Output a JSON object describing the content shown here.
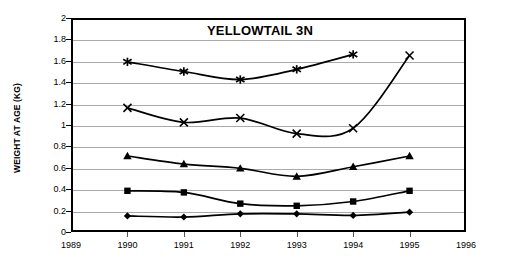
{
  "chart_data": {
    "type": "line",
    "title": "YELLOWTAIL 3N",
    "xlabel": "",
    "ylabel": "WEIGHT AT AGE (KG)",
    "xlim": [
      1989,
      1996
    ],
    "ylim": [
      0,
      2
    ],
    "grid": true,
    "legend": "none",
    "x": [
      1990,
      1991,
      1992,
      1993,
      1994,
      1995
    ],
    "xticks": [
      "1989",
      "1990",
      "1991",
      "1992",
      "1993",
      "1994",
      "1995",
      "1996"
    ],
    "xtick_values": [
      1989,
      1990,
      1991,
      1992,
      1993,
      1994,
      1995,
      1996
    ],
    "yticks": [
      "0",
      "0.2",
      "0.4",
      "0.6",
      "0.8",
      "1",
      "1.2",
      "1.4",
      "1.6",
      "1.8",
      "2"
    ],
    "ytick_values": [
      0,
      0.2,
      0.4,
      0.6,
      0.8,
      1,
      1.2,
      1.4,
      1.6,
      1.8,
      2
    ],
    "series": [
      {
        "name": "Age 1",
        "marker": "diamond",
        "x": [
          1990,
          1991,
          1992,
          1993,
          1994,
          1995
        ],
        "values": [
          0.15,
          0.14,
          0.17,
          0.17,
          0.155,
          0.185
        ]
      },
      {
        "name": "Age 2",
        "marker": "square",
        "x": [
          1990,
          1991,
          1992,
          1993,
          1994,
          1995
        ],
        "values": [
          0.385,
          0.37,
          0.265,
          0.245,
          0.285,
          0.385
        ]
      },
      {
        "name": "Age 3",
        "marker": "triangle",
        "x": [
          1990,
          1991,
          1992,
          1993,
          1994,
          1995
        ],
        "values": [
          0.71,
          0.635,
          0.595,
          0.52,
          0.61,
          0.71
        ]
      },
      {
        "name": "Age 4",
        "marker": "cross",
        "x": [
          1990,
          1991,
          1992,
          1993,
          1994,
          1995
        ],
        "values": [
          1.16,
          1.025,
          1.065,
          0.92,
          0.97,
          1.65
        ]
      },
      {
        "name": "Age 5",
        "marker": "asterisk",
        "x": [
          1990,
          1991,
          1992,
          1993,
          1994
        ],
        "values": [
          1.59,
          1.5,
          1.425,
          1.52,
          1.66
        ]
      }
    ]
  },
  "style": {
    "line_color": "#000000",
    "grid_color": "#a9a9a9",
    "axis_color": "#000000",
    "background": "#ffffff"
  }
}
